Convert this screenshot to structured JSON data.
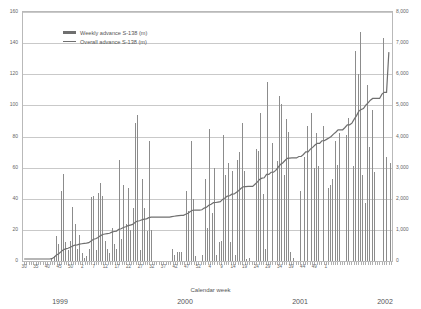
{
  "chart_data": {
    "type": "bar",
    "title": "",
    "xlabel": "Calendar week",
    "ylabel": "",
    "ylim": [
      0,
      160
    ],
    "y2lim": [
      0,
      8000
    ],
    "grid": true,
    "legend_position": "top-left",
    "legend": [
      {
        "name": "Weekly advance S-138 (m)",
        "marker": "bar",
        "color": "#6f6f6f"
      },
      {
        "name": "Overall advance S-138 (m)",
        "marker": "line",
        "color": "#6f6f6f"
      }
    ],
    "y_ticks_left": [
      "0",
      "20",
      "40",
      "60",
      "80",
      "100",
      "120",
      "140",
      "160"
    ],
    "y_ticks_right": [
      "0",
      "1,000",
      "2,000",
      "3,000",
      "4,000",
      "5,000",
      "6,000",
      "7,000",
      "8,000"
    ],
    "x_ticks": [
      "30",
      "35",
      "40",
      "45",
      "50",
      "2",
      "7",
      "12",
      "17",
      "22",
      "27",
      "32",
      "37",
      "42",
      "47",
      "52",
      "4",
      "9",
      "14",
      "19",
      "24",
      "29",
      "34",
      "39",
      "44",
      "49",
      "1"
    ],
    "year_labels": [
      "1999",
      "2000",
      "2001",
      "2002"
    ],
    "series": [
      {
        "name": "Weekly advance S-138 (m)",
        "axis": "left",
        "values": [
          0,
          0,
          0,
          0,
          0,
          0,
          0,
          0,
          0,
          0,
          0,
          0,
          1,
          3,
          16,
          11,
          45,
          56,
          12,
          7,
          13,
          35,
          24,
          8,
          17,
          5,
          2,
          3,
          8,
          41,
          42,
          7,
          44,
          50,
          42,
          13,
          8,
          5,
          21,
          11,
          8,
          65,
          14,
          49,
          24,
          47,
          20,
          34,
          89,
          94,
          7,
          53,
          34,
          19,
          77,
          20,
          0,
          0,
          0,
          0,
          0,
          0,
          0,
          0,
          8,
          4,
          6,
          6,
          6,
          0,
          45,
          32,
          77,
          40,
          3,
          0,
          0,
          4,
          53,
          21,
          85,
          31,
          60,
          4,
          12,
          13,
          81,
          55,
          63,
          12,
          58,
          4,
          65,
          70,
          89,
          58,
          1,
          2,
          0,
          0,
          72,
          71,
          95,
          43,
          8,
          115,
          0,
          76,
          0,
          64,
          106,
          101,
          55,
          91,
          83,
          6,
          2,
          0,
          0,
          45,
          0,
          67,
          87,
          0,
          95,
          60,
          82,
          61,
          0,
          87,
          0,
          47,
          49,
          53,
          77,
          62,
          82,
          0,
          0,
          81,
          92,
          0,
          61,
          135,
          120,
          147,
          55,
          37,
          113,
          73,
          97,
          57,
          0,
          0,
          0,
          143,
          67,
          0,
          63
        ]
      },
      {
        "name": "Overall advance S-138 (m)",
        "axis": "right",
        "values": [
          0,
          0,
          0,
          0,
          0,
          0,
          0,
          0,
          0,
          0,
          0,
          0,
          10,
          60,
          130,
          170,
          240,
          300,
          330,
          350,
          380,
          420,
          450,
          460,
          480,
          495,
          505,
          515,
          530,
          580,
          640,
          655,
          700,
          750,
          795,
          810,
          825,
          835,
          870,
          890,
          905,
          960,
          980,
          1020,
          1045,
          1080,
          1100,
          1120,
          1180,
          1230,
          1240,
          1270,
          1290,
          1300,
          1340,
          1355,
          1355,
          1355,
          1355,
          1355,
          1355,
          1355,
          1355,
          1355,
          1375,
          1385,
          1395,
          1405,
          1415,
          1415,
          1450,
          1480,
          1540,
          1580,
          1585,
          1585,
          1585,
          1595,
          1650,
          1675,
          1740,
          1775,
          1825,
          1830,
          1845,
          1860,
          1930,
          1980,
          2035,
          2050,
          2100,
          2105,
          2160,
          2220,
          2290,
          2340,
          2345,
          2350,
          2350,
          2350,
          2420,
          2490,
          2580,
          2620,
          2630,
          2740,
          2740,
          2810,
          2810,
          2870,
          2970,
          3060,
          3110,
          3190,
          3260,
          3270,
          3275,
          3275,
          3275,
          3320,
          3320,
          3385,
          3470,
          3470,
          3560,
          3615,
          3690,
          3745,
          3745,
          3830,
          3830,
          3875,
          3920,
          3970,
          4045,
          4105,
          4185,
          4185,
          4185,
          4260,
          4345,
          4345,
          4400,
          4530,
          4645,
          4790,
          4840,
          4875,
          4985,
          5055,
          5145,
          5200,
          5200,
          5200,
          5200,
          5340,
          5400,
          5400,
          6700
        ]
      }
    ]
  }
}
